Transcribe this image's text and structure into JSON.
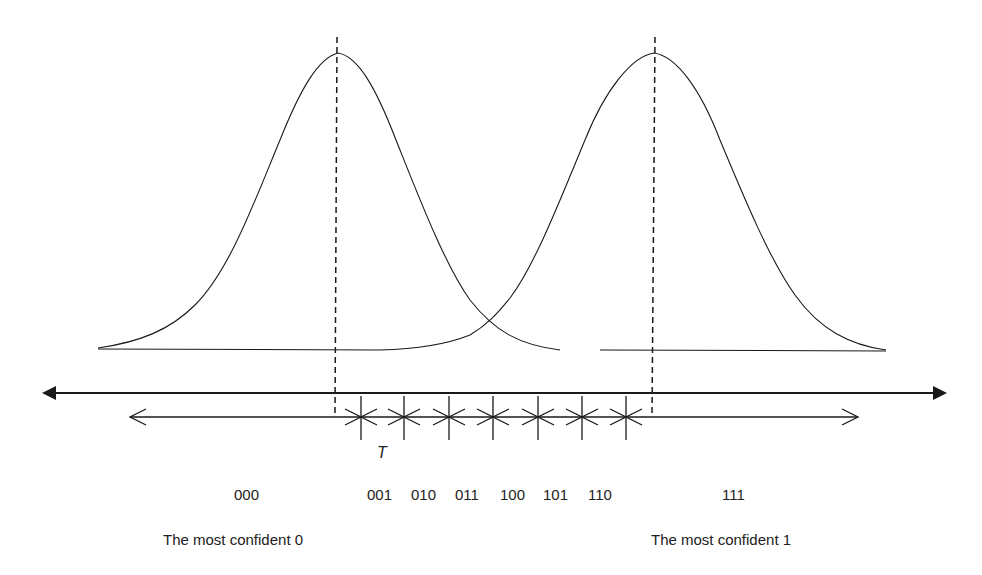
{
  "diagram": {
    "curves": [
      {
        "name": "distribution-0",
        "mean_x": 338,
        "peak_y": 53
      },
      {
        "name": "distribution-1",
        "mean_x": 654,
        "peak_y": 53
      }
    ],
    "interval_label": "T",
    "codes": [
      "000",
      "001",
      "010",
      "011",
      "100",
      "101",
      "110",
      "111"
    ],
    "captions": {
      "left": "The most confident 0",
      "right": "The most confident 1"
    },
    "colors": {
      "line": "#1a1a1a",
      "background": "#ffffff"
    }
  }
}
